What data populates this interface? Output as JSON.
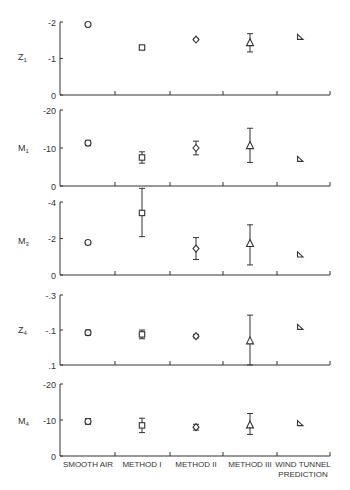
{
  "chart_data": {
    "type": "scatter",
    "subtype": "multi-panel point estimates with error bars",
    "categories": [
      "SMOOTH AIR",
      "METHOD I",
      "METHOD II",
      "METHOD III",
      "WIND TUNNEL PREDICTION"
    ],
    "category_label_lines": [
      [
        "SMOOTH AIR"
      ],
      [
        "METHOD I"
      ],
      [
        "METHOD II"
      ],
      [
        "METHOD III"
      ],
      [
        "WIND TUNNEL",
        "PREDICTION"
      ]
    ],
    "markers": [
      "circle",
      "square",
      "diamond",
      "triangle",
      "right-triangle"
    ],
    "panels": [
      {
        "ylabel": "Z",
        "ylabel_sub": "1",
        "yticks": [
          {
            "v": 0,
            "label": "0"
          },
          {
            "v": -1,
            "label": "-1"
          },
          {
            "v": -2,
            "label": "-2"
          }
        ],
        "ylim": [
          0,
          -2
        ],
        "values": [
          -1.93,
          -1.3,
          -1.52,
          -1.42,
          -1.58
        ],
        "err_low": [
          -1.88,
          -1.25,
          -1.49,
          -1.18,
          null
        ],
        "err_high": [
          -1.98,
          -1.35,
          -1.55,
          -1.68,
          null
        ]
      },
      {
        "ylabel": "M",
        "ylabel_sub": "1",
        "yticks": [
          {
            "v": 0,
            "label": "0"
          },
          {
            "v": -10,
            "label": "-10"
          },
          {
            "v": -20,
            "label": "-20"
          }
        ],
        "ylim": [
          0,
          -20
        ],
        "values": [
          -11.3,
          -7.5,
          -10.0,
          -10.5,
          -7.0
        ],
        "err_low": [
          -10.6,
          -6.0,
          -8.2,
          -6.2,
          null
        ],
        "err_high": [
          -12.0,
          -9.0,
          -11.8,
          -15.2,
          null
        ]
      },
      {
        "ylabel": "M",
        "ylabel_sub": "3",
        "yticks": [
          {
            "v": 0,
            "label": "0"
          },
          {
            "v": -2,
            "label": "-2"
          },
          {
            "v": -4,
            "label": "-4"
          }
        ],
        "ylim": [
          0,
          -4
        ],
        "values": [
          -1.78,
          -3.4,
          -1.45,
          -1.7,
          -1.1
        ],
        "err_low": [
          -1.68,
          -2.1,
          -0.85,
          -0.55,
          null
        ],
        "err_high": [
          -1.88,
          -4.75,
          -2.05,
          -2.75,
          null
        ]
      },
      {
        "ylabel": "Z",
        "ylabel_sub": "4",
        "yticks": [
          {
            "v": 0.1,
            "label": ".1"
          },
          {
            "v": -0.1,
            "label": "-.1"
          },
          {
            "v": -0.3,
            "label": "-.3"
          }
        ],
        "ylim": [
          0.1,
          -0.3
        ],
        "values": [
          -0.085,
          -0.075,
          -0.065,
          -0.035,
          -0.115
        ],
        "err_low": [
          -0.07,
          -0.05,
          -0.055,
          0.1,
          null
        ],
        "err_high": [
          -0.1,
          -0.1,
          -0.075,
          -0.185,
          null
        ]
      },
      {
        "ylabel": "M",
        "ylabel_sub": "4",
        "yticks": [
          {
            "v": 0,
            "label": "0"
          },
          {
            "v": -10,
            "label": "-10"
          },
          {
            "v": -20,
            "label": "-20"
          }
        ],
        "ylim": [
          0,
          -20
        ],
        "values": [
          -9.6,
          -8.5,
          -8.0,
          -8.5,
          -9.0
        ],
        "err_low": [
          -8.8,
          -6.5,
          -7.2,
          -6.0,
          null
        ],
        "err_high": [
          -10.4,
          -10.5,
          -8.8,
          -11.8,
          null
        ]
      }
    ],
    "title": "",
    "xlabel": "",
    "grid": false,
    "legend": null
  }
}
